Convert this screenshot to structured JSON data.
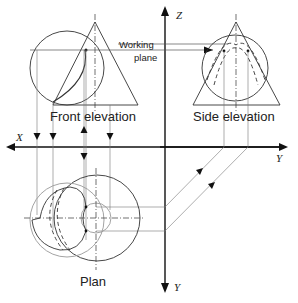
{
  "diagram": {
    "type": "orthographic projection - intersection of sphere and cone",
    "labels": {
      "front_elevation": "Front elevation",
      "side_elevation": "Side elevation",
      "plan": "Plan",
      "working_plane_line1": "Working",
      "working_plane_line2": "plane"
    },
    "axes": {
      "x": "X",
      "y_horizontal": "Y",
      "z": "Z",
      "y_vertical": "Y"
    },
    "colors": {
      "line": "#222222",
      "construction": "#888888",
      "background": "#ffffff"
    }
  }
}
